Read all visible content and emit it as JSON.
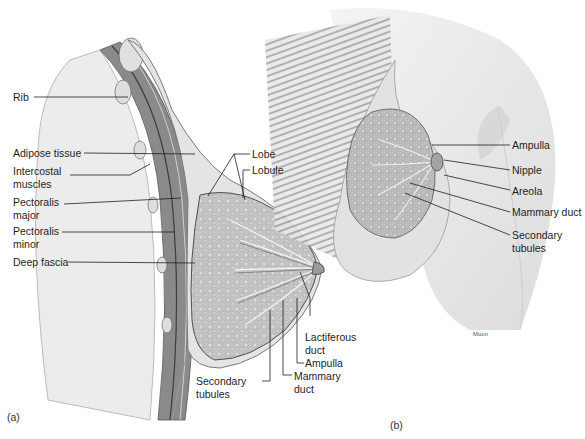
{
  "figure": {
    "panels": [
      {
        "id": "a",
        "label": "(a)"
      },
      {
        "id": "b",
        "label": "(b)"
      }
    ],
    "signature": "Moon"
  },
  "panel_a": {
    "view": "sagittal-section",
    "labels": {
      "rib": "Rib",
      "adipose_tissue": "Adipose tissue",
      "intercostal_muscles": "Intercostal\nmuscles",
      "pectoralis_major": "Pectoralis\nmajor",
      "pectoralis_minor": "Pectoralis\nminor",
      "deep_fascia": "Deep fascia",
      "lobe": "Lobe",
      "lobule": "Lobule",
      "lactiferous_duct": "Lactiferous\nduct",
      "ampulla": "Ampulla",
      "secondary_tubules": "Secondary\ntubules",
      "mammary_duct": "Mammary\nduct"
    }
  },
  "panel_b": {
    "view": "anterior-cutaway",
    "labels": {
      "ampulla": "Ampulla",
      "nipple": "Nipple",
      "areola": "Areola",
      "mammary_duct": "Mammary duct",
      "secondary_tubules": "Secondary\ntubules"
    }
  },
  "colors": {
    "background": "#ffffff",
    "tissue_light": "#e6e6e6",
    "tissue_mid": "#bdbdbd",
    "tissue_dark": "#6e6e6e",
    "leader_line": "#1e1e1e"
  }
}
